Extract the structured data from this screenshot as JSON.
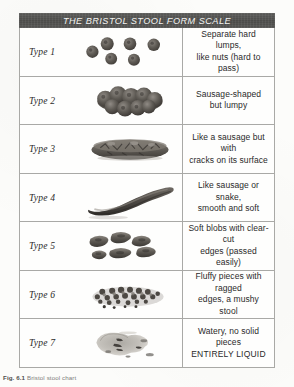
{
  "figure": {
    "title": "THE BRISTOL STOOL FORM SCALE",
    "caption_number": "Fig. 6.1",
    "caption_text": "Bristol stool chart",
    "colors": {
      "header_bg": "#4a4a48",
      "header_text": "#f4f4f2",
      "border": "#a9a9a6",
      "page_bg": "#fcfcfa",
      "stool_dark": "#4b4743",
      "stool_mid": "#6e6a64",
      "stool_light": "#b4b0aa",
      "body_text": "#2a2a2a"
    },
    "rows": [
      {
        "type_label": "Type 1",
        "art_name": "separate-hard-lumps-illustration",
        "art_kind": "lumps",
        "description_lines": [
          "Separate hard lumps,",
          "like nuts (hard to pass)"
        ]
      },
      {
        "type_label": "Type 2",
        "art_name": "lumpy-sausage-illustration",
        "art_kind": "lumpy-sausage",
        "description_lines": [
          "Sausage-shaped",
          "but lumpy"
        ]
      },
      {
        "type_label": "Type 3",
        "art_name": "cracked-sausage-illustration",
        "art_kind": "cracked-sausage",
        "description_lines": [
          "Like a sausage but with",
          "cracks on its surface"
        ]
      },
      {
        "type_label": "Type 4",
        "art_name": "smooth-snake-illustration",
        "art_kind": "smooth-snake",
        "description_lines": [
          "Like sausage or snake,",
          "smooth and soft"
        ]
      },
      {
        "type_label": "Type 5",
        "art_name": "soft-blobs-illustration",
        "art_kind": "soft-blobs",
        "description_lines": [
          "Soft blobs with clear-cut",
          "edges (passed easily)"
        ]
      },
      {
        "type_label": "Type 6",
        "art_name": "fluffy-mushy-pieces-illustration",
        "art_kind": "fluffy-pieces",
        "description_lines": [
          "Fluffy pieces with ragged",
          "edges, a mushy stool"
        ]
      },
      {
        "type_label": "Type 7",
        "art_name": "watery-liquid-illustration",
        "art_kind": "watery",
        "description_lines": [
          "Watery, no solid pieces",
          "ENTIRELY LIQUID"
        ]
      }
    ]
  }
}
